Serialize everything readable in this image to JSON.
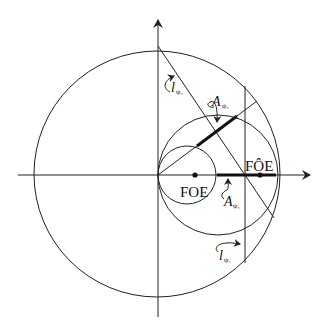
{
  "diagram": {
    "labels": {
      "foe": "FOE",
      "foe_hat": "FÔE",
      "l_psi2": "l",
      "l_psi2_sub": "ψ₂",
      "a_psi2": "A",
      "a_psi2_sub": "ψ₂",
      "a_psi1": "A",
      "a_psi1_sub": "ψ₁",
      "l_psi1": "l",
      "l_psi1_sub": "ψ₁"
    },
    "colors": {
      "stroke": "#222222",
      "background": "#ffffff"
    }
  }
}
